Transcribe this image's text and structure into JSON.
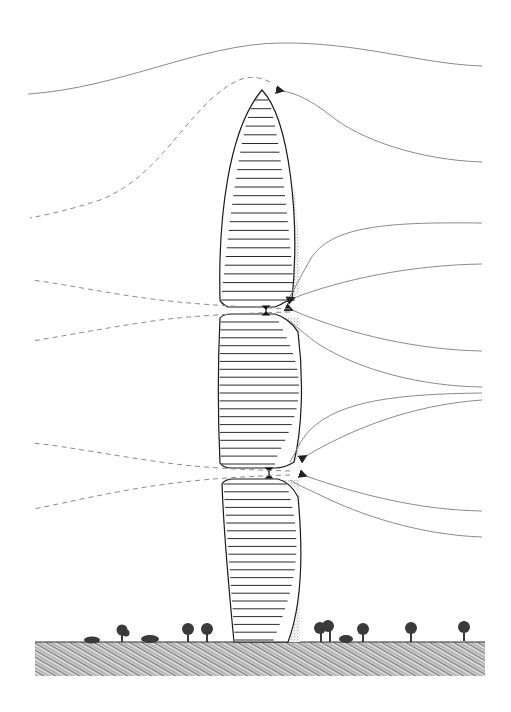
{
  "diagram": {
    "type": "architectural-wind-flow-section",
    "colors": {
      "background": "#ffffff",
      "outline": "#1a1a1a",
      "floor_lines": "#2a2a2a",
      "streamline": "#8a8a8a",
      "dashed_streamline": "#8a8a8a",
      "stipple": "#9a9a9a",
      "ground": "#7a7a7a",
      "trees": "#3a3a3a"
    },
    "tower": {
      "apex": [
        262,
        90
      ],
      "base_left_x": 234,
      "base_right_x": 300,
      "ground_y": 642,
      "segments": [
        {
          "name": "upper",
          "top": 90,
          "bottom": 302,
          "floors": 24
        },
        {
          "name": "middle",
          "top": 318,
          "bottom": 466,
          "floors": 19
        },
        {
          "name": "lower",
          "top": 480,
          "bottom": 642,
          "floors": 21
        }
      ],
      "gaps": [
        {
          "y": 310,
          "label_mark": "double-arrow"
        },
        {
          "y": 473,
          "label_mark": "double-arrow"
        }
      ]
    },
    "streamlines_right_endpoints_y": [
      66,
      162,
      223,
      264,
      351,
      387,
      393,
      400,
      511,
      537
    ],
    "trees_x": [
      92,
      122,
      150,
      187,
      207,
      321,
      330,
      362,
      410,
      463
    ]
  }
}
